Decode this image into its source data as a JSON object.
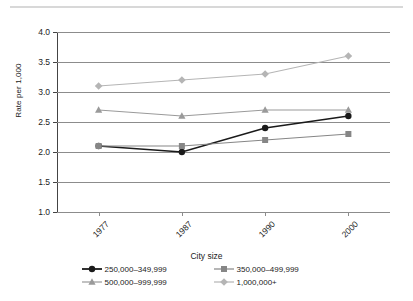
{
  "chart_data": {
    "type": "line",
    "title": "",
    "xlabel": "City size",
    "ylabel": "Rate per 1,000",
    "categories": [
      "1977",
      "1987",
      "1990",
      "2000"
    ],
    "ylim": [
      1.0,
      4.0
    ],
    "ytick_labels": [
      "1.0",
      "1.5",
      "2.0",
      "2.5",
      "3.0",
      "3.5",
      "4.0"
    ],
    "ytick_values": [
      1.0,
      1.5,
      2.0,
      2.5,
      3.0,
      3.5,
      4.0
    ],
    "grid": true,
    "legend_position": "bottom",
    "series": [
      {
        "name": "250,000–349,999",
        "values": [
          2.1,
          2.0,
          2.4,
          2.6
        ],
        "color": "#1a1a1a",
        "marker": "circle"
      },
      {
        "name": "350,000–499,999",
        "values": [
          2.1,
          2.1,
          2.2,
          2.3
        ],
        "color": "#868686",
        "marker": "square"
      },
      {
        "name": "500,000–999,999",
        "values": [
          2.7,
          2.6,
          2.7,
          2.7
        ],
        "color": "#9a9a9a",
        "marker": "triangle"
      },
      {
        "name": "1,000,000+",
        "values": [
          3.1,
          3.2,
          3.3,
          3.6
        ],
        "color": "#b5b5b5",
        "marker": "diamond"
      }
    ]
  },
  "axis": {
    "y_title": "Rate per 1,000",
    "x_title": "City size"
  },
  "legend": {
    "items": [
      {
        "label": "250,000–349,999"
      },
      {
        "label": "350,000–499,999"
      },
      {
        "label": "500,000–999,999"
      },
      {
        "label": "1,000,000+"
      }
    ]
  },
  "colors": {
    "series_1": "#1a1a1a",
    "series_2": "#868686",
    "series_3": "#9a9a9a",
    "series_4": "#b5b5b5",
    "grid": "#8c8c8c",
    "axis": "#444444",
    "rule": "#d8d8d8"
  }
}
